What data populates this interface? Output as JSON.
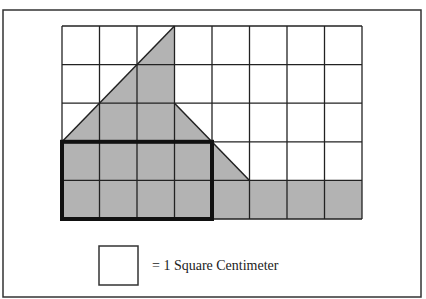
{
  "figure": {
    "frame": {
      "x": 3,
      "y": 10,
      "width": 418,
      "height": 287,
      "stroke": "#333333"
    },
    "grid": {
      "columns": 8,
      "rows": 5,
      "x": 62,
      "y": 26,
      "cell_width": 37.5,
      "cell_height": 38.6,
      "line_color": "#222222"
    },
    "shaded_color": "#b3b3b3",
    "shaded_region_grid_units": [
      [
        3,
        0
      ],
      [
        3,
        2
      ],
      [
        5,
        4
      ],
      [
        8,
        4
      ],
      [
        8,
        5
      ],
      [
        0,
        5
      ],
      [
        0,
        3
      ]
    ],
    "bold_rectangle_grid_units": {
      "x0": 0,
      "y0": 3,
      "x1": 4,
      "y1": 5,
      "stroke": "#111111",
      "stroke_width": 4
    },
    "shapes_description": [
      "triangle: apex (3,0), base (0,3)-(3,3)",
      "trapezoid region under diagonal from (3,2) to (5,4)",
      "shaded bottom row from column 4 to 8",
      "bold rectangle 4 x 2 units at bottom-left"
    ]
  },
  "legend": {
    "square": {
      "x": 99,
      "y": 246,
      "size": 39
    },
    "label": "= 1 Square Centimeter"
  }
}
